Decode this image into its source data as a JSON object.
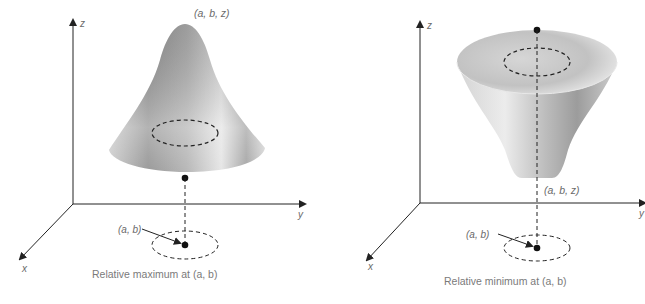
{
  "figures": [
    {
      "id": "max",
      "axes": {
        "x": "x",
        "y": "y",
        "z": "z"
      },
      "point_label_3d": "(a, b, z)",
      "point_label_2d": "(a, b)",
      "caption": "Relative maximum at (a, b)",
      "surface": "peak"
    },
    {
      "id": "min",
      "axes": {
        "x": "x",
        "y": "y",
        "z": "z"
      },
      "point_label_3d": "(a, b, z)",
      "point_label_2d": "(a, b)",
      "caption": "Relative minimum at (a, b)",
      "surface": "funnel"
    }
  ],
  "colors": {
    "axis": "#222222",
    "surface_dark": "#8c8c8c",
    "surface_light": "#f2f2f2",
    "text": "#6a6a6a"
  }
}
